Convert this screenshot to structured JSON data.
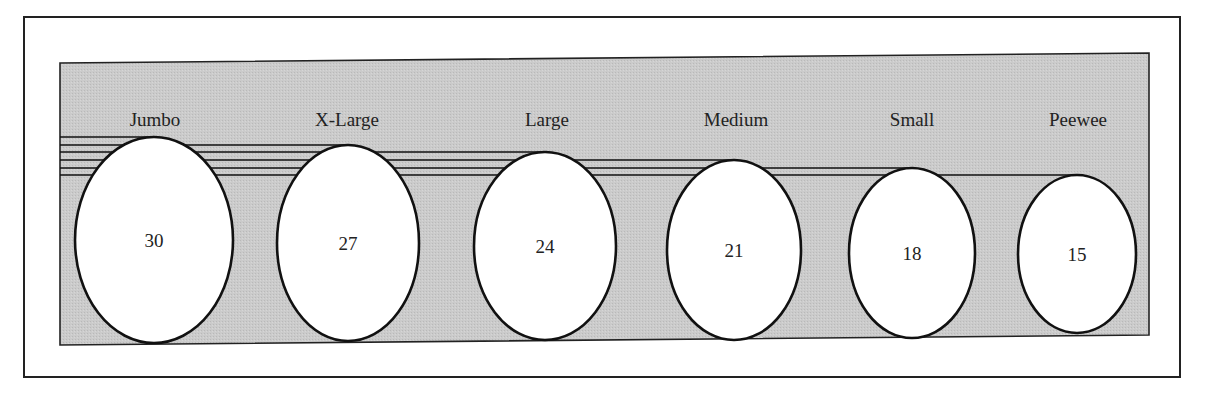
{
  "chart_data": {
    "type": "pictograph",
    "title": "",
    "xlabel": "",
    "ylabel": "",
    "categories": [
      "Jumbo",
      "X-Large",
      "Large",
      "Medium",
      "Small",
      "Peewee"
    ],
    "values": [
      30,
      27,
      24,
      21,
      18,
      15
    ],
    "series": [
      {
        "name": "Egg size",
        "values": [
          30,
          27,
          24,
          21,
          18,
          15
        ]
      }
    ],
    "legend": null,
    "grid": false,
    "ylim": [
      0,
      30
    ]
  },
  "colors": {
    "panel_fill": "#c8c8c8",
    "egg_fill": "#ffffff",
    "stroke": "#111111",
    "frame": "#222222"
  },
  "eggs": [
    {
      "label": "Jumbo",
      "value": "30",
      "cx": 154,
      "cy": 240,
      "rx": 79,
      "ry": 103,
      "lx": 155
    },
    {
      "label": "X-Large",
      "value": "27",
      "cx": 348,
      "cy": 243,
      "rx": 71,
      "ry": 98,
      "lx": 347
    },
    {
      "label": "Large",
      "value": "24",
      "cx": 545,
      "cy": 246,
      "rx": 71,
      "ry": 94,
      "lx": 547
    },
    {
      "label": "Medium",
      "value": "21",
      "cx": 734,
      "cy": 250,
      "rx": 67,
      "ry": 90,
      "lx": 736
    },
    {
      "label": "Small",
      "value": "18",
      "cx": 912,
      "cy": 253,
      "rx": 63,
      "ry": 85,
      "lx": 912
    },
    {
      "label": "Peewee",
      "value": "15",
      "cx": 1077,
      "cy": 254,
      "rx": 59,
      "ry": 79,
      "lx": 1078
    }
  ]
}
